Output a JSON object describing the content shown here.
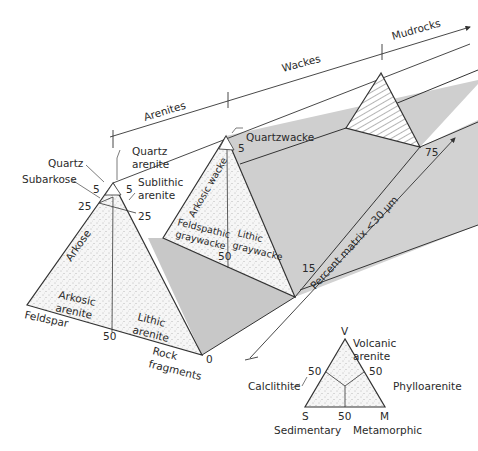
{
  "groups": {
    "arenites": "Arenites",
    "wackes": "Wackes",
    "mudrocks": "Mudrocks"
  },
  "axis": {
    "matrix_label": "Percent matrix <30 µm",
    "ticks": [
      "0",
      "15",
      "75"
    ]
  },
  "arenite_triangle": {
    "apex_label": "Quartz",
    "left_label": "Feldspar",
    "right_label": "Rock fragments",
    "fields": {
      "quartz_arenite": "Quartz arenite",
      "subarkose": "Subarkose",
      "sublithic_arenite": "Sublithic arenite",
      "arkose": "Arkose",
      "arkosic_arenite": "Arkosic arenite",
      "lithic_arenite": "Lithic arenite"
    },
    "ticks": {
      "left_5": "5",
      "left_25": "25",
      "right_5": "5",
      "right_25": "25",
      "base_50": "50"
    }
  },
  "wacke_triangle": {
    "fields": {
      "quartzwacke": "Quartzwacke",
      "arkosic_wacke": "Arkosic wacke",
      "feldspathic_graywacke": "Feldspathic graywacke",
      "lithic_graywacke": "Lithic graywacke"
    },
    "ticks": {
      "right_5": "5",
      "base_50": "50"
    }
  },
  "rock_fragment_triangle": {
    "apex": "V",
    "left": "S",
    "right": "M",
    "left_name": "Sedimentary",
    "right_name": "Metamorphic",
    "fields": {
      "volcanic_arenite": "Volcanic arenite",
      "calclithite": "Calclithite",
      "phylloarenite": "Phylloarenite"
    },
    "ticks": {
      "left_50": "50",
      "right_50": "50",
      "base_50": "50"
    }
  },
  "colors": {
    "line": "#3a3a3a",
    "band_fill": "#c9c9c9",
    "stipple_fill": "#f3f3f3"
  }
}
